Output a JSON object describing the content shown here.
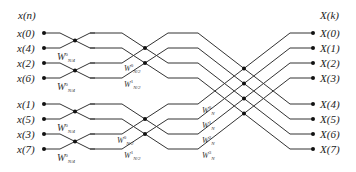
{
  "diagram": {
    "type": "8-point decimation-in-time FFT butterfly flow graph",
    "input_header": "x(n)",
    "output_header": "X(k)",
    "inputs": [
      "x(0)",
      "x(4)",
      "x(2)",
      "x(6)",
      "x(1)",
      "x(5)",
      "x(3)",
      "x(7)"
    ],
    "outputs": [
      "X(0)",
      "X(1)",
      "X(2)",
      "X(3)",
      "X(4)",
      "X(5)",
      "X(6)",
      "X(7)"
    ],
    "stage1_twiddles": [
      {
        "base": "W",
        "sup": "0",
        "sub": "N/4"
      },
      {
        "base": "W",
        "sup": "0",
        "sub": "N/4"
      },
      {
        "base": "W",
        "sup": "0",
        "sub": "N/4"
      },
      {
        "base": "W",
        "sup": "0",
        "sub": "N/4"
      }
    ],
    "stage2_twiddles": [
      {
        "base": "W",
        "sup": "0",
        "sub": "N/2"
      },
      {
        "base": "W",
        "sup": "1",
        "sub": "N/2"
      },
      {
        "base": "W",
        "sup": "0",
        "sub": "N/2"
      },
      {
        "base": "W",
        "sup": "1",
        "sub": "N/2"
      }
    ],
    "stage3_twiddles": [
      {
        "base": "W",
        "sup": "0",
        "sub": "N"
      },
      {
        "base": "W",
        "sup": "1",
        "sub": "N"
      },
      {
        "base": "W",
        "sup": "2",
        "sub": "N"
      },
      {
        "base": "W",
        "sup": "3",
        "sub": "N"
      }
    ]
  }
}
